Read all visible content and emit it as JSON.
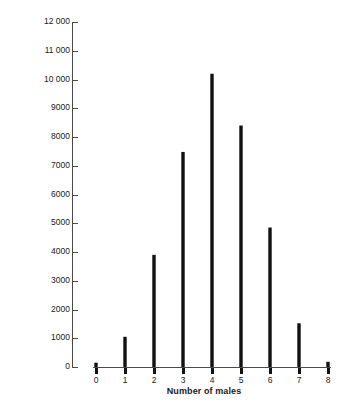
{
  "chart_data": {
    "type": "bar",
    "title": "",
    "xlabel": "Number of males",
    "ylabel": "Frequency",
    "categories": [
      "0",
      "1",
      "2",
      "3",
      "4",
      "5",
      "6",
      "7",
      "8"
    ],
    "values": [
      150,
      1050,
      3900,
      7480,
      10200,
      8400,
      4850,
      1520,
      180
    ],
    "xlim": [
      0,
      8
    ],
    "ylim": [
      0,
      12000
    ],
    "y_ticks": [
      0,
      1000,
      2000,
      3000,
      4000,
      5000,
      6000,
      7000,
      8000,
      9000,
      10000,
      11000,
      12000
    ],
    "y_tick_labels": [
      "0",
      "1000",
      "2000",
      "3000",
      "4000",
      "5000",
      "6000",
      "7000",
      "8000",
      "9000",
      "10 000",
      "11 000",
      "12 000"
    ],
    "x_ticks": [
      0,
      1,
      2,
      3,
      4,
      5,
      6,
      7,
      8
    ],
    "x_tick_labels": [
      "0",
      "1",
      "2",
      "3",
      "4",
      "5",
      "6",
      "7",
      "8"
    ],
    "grid": false,
    "legend": null,
    "bar_color": "#111111",
    "axis_color": "#4a4a4a",
    "background": "#ffffff"
  }
}
